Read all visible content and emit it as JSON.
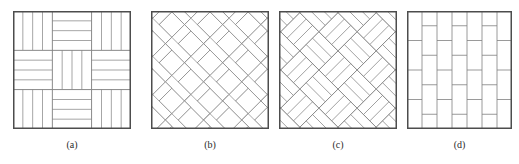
{
  "figure": {
    "width": 519,
    "height": 164,
    "background": "#ffffff",
    "stroke_color": "#808080",
    "border_color": "#4d4d4d",
    "fill_color": "#ffffff"
  },
  "panels": [
    {
      "id": "panel-a",
      "caption": "(a)",
      "pattern_name": "basketweave",
      "x": 13,
      "y": 11,
      "size": 118,
      "blocks_per_side": 3,
      "planks_per_block": 4,
      "caption_x": 13,
      "caption_y": 139
    },
    {
      "id": "panel-b",
      "caption": "(b)",
      "pattern_name": "herringbone",
      "x": 151,
      "y": 11,
      "size": 118,
      "plank_width": 9,
      "plank_length": 27,
      "angle_deg": 45,
      "caption_x": 151,
      "caption_y": 139
    },
    {
      "id": "panel-c",
      "caption": "(c)",
      "pattern_name": "diagonal-basketweave",
      "x": 279,
      "y": 11,
      "size": 118,
      "blocks_per_side": 4,
      "planks_per_block": 3,
      "angle_deg": 45,
      "caption_x": 279,
      "caption_y": 139
    },
    {
      "id": "panel-d",
      "caption": "(d)",
      "pattern_name": "running-bond",
      "x": 407,
      "y": 11,
      "size": 105,
      "columns": 7,
      "rows": 4,
      "stagger": "half-offset",
      "caption_x": 407,
      "caption_y": 139
    }
  ]
}
